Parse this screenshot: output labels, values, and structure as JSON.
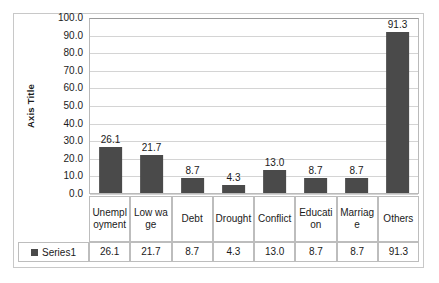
{
  "chart_data": {
    "type": "bar",
    "title": "",
    "xlabel": "",
    "ylabel": "Axis Title",
    "ylim": [
      0,
      100
    ],
    "ytick_step": 10,
    "grid": true,
    "legend_position": "data-table-row",
    "bar_color": "#4a4a4a",
    "categories": [
      "Unemployment",
      "Low wage",
      "Debt",
      "Drought",
      "Conflict",
      "Education",
      "Marriage",
      "Others"
    ],
    "series": [
      {
        "name": "Series1",
        "values": [
          26.1,
          21.7,
          8.7,
          4.3,
          13.0,
          8.7,
          8.7,
          91.3
        ]
      }
    ],
    "value_labels": [
      "26.1",
      "21.7",
      "8.7",
      "4.3",
      "13.0",
      "8.7",
      "8.7",
      "91.3"
    ],
    "ytick_labels": [
      "100.0",
      "90.0",
      "80.0",
      "70.0",
      "60.0",
      "50.0",
      "40.0",
      "30.0",
      "20.0",
      "10.0",
      "0.0"
    ]
  },
  "axis": {
    "title": "Axis Title"
  },
  "legend": {
    "series_label": "Series1"
  }
}
